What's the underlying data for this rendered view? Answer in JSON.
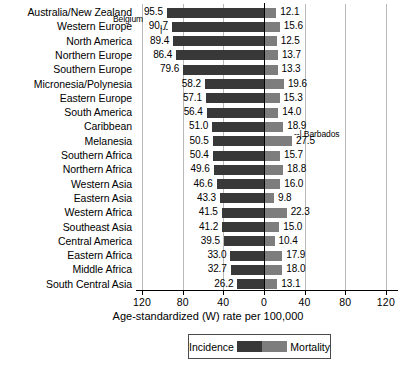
{
  "chart_data": {
    "type": "bar",
    "orientation": "horizontal-diverging",
    "title": "",
    "xlabel": "Age-standardized (W) rate per 100,000",
    "ylabel": "",
    "xlim": [
      -140,
      140
    ],
    "xticks": [
      120,
      80,
      40,
      0,
      40,
      80,
      120
    ],
    "grid": true,
    "legend_position": "bottom",
    "categories": [
      "Australia/New Zealand",
      "Western Europe",
      "North America",
      "Northern Europe",
      "Southern Europe",
      "Micronesia/Polynesia",
      "Eastern Europe",
      "South America",
      "Caribbean",
      "Melanesia",
      "Southern Africa",
      "Northern Africa",
      "Western Asia",
      "Eastern Asia",
      "Western Africa",
      "Southeast Asia",
      "Central America",
      "Eastern Africa",
      "Middle Africa",
      "South Central Asia"
    ],
    "series": [
      {
        "name": "Incidence",
        "color": "#383838",
        "side": "left",
        "values": [
          95.5,
          90.7,
          89.4,
          86.4,
          79.6,
          58.2,
          57.1,
          56.4,
          51.0,
          50.5,
          50.4,
          49.6,
          46.6,
          43.3,
          41.5,
          41.2,
          39.5,
          33.0,
          32.7,
          26.2
        ]
      },
      {
        "name": "Mortality",
        "color": "#7d7d7d",
        "side": "right",
        "values": [
          12.1,
          15.6,
          12.5,
          13.7,
          13.3,
          19.6,
          15.3,
          14.0,
          18.9,
          27.5,
          15.7,
          18.8,
          16.0,
          9.8,
          22.3,
          15.0,
          10.4,
          17.9,
          18.0,
          13.1
        ]
      }
    ],
    "annotations": [
      {
        "text": "Belgium",
        "target_category": "Western Europe",
        "target_value": 90.7,
        "side": "left",
        "marker": "|--"
      },
      {
        "text": "Barbados",
        "target_category": "Caribbean",
        "target_value": 18.9,
        "side": "right",
        "marker": "--|"
      }
    ]
  },
  "legend": {
    "incidence_label": "Incidence",
    "mortality_label": "Mortality"
  },
  "axis": {
    "tick_labels": [
      "120",
      "80",
      "40",
      "0",
      "40",
      "80",
      "120"
    ],
    "title": "Age-standardized (W) rate per 100,000"
  },
  "annotations": {
    "belgium": "Belgium",
    "belgium_marker": "|--",
    "barbados": "Barbados",
    "barbados_marker": "--|"
  }
}
